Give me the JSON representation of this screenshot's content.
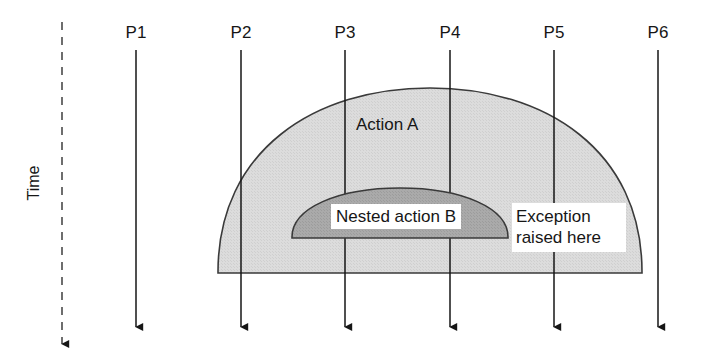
{
  "diagram": {
    "background_color": "#ffffff",
    "stroke_color": "#1a1a1a",
    "outer_region_fill": "#d9d9d9",
    "nested_region_fill": "#a8a8a8",
    "callout_fill": "#ffffff"
  },
  "axis": {
    "time_label": "Time",
    "time_arrow_direction": "down",
    "time_line_style": "dashed",
    "time_line_x": 62,
    "time_line_top_y": 22,
    "time_line_bottom_y": 352
  },
  "participants": [
    {
      "label": "P1",
      "x": 136,
      "line_top_y": 50,
      "line_bottom_y": 334
    },
    {
      "label": "P2",
      "x": 241,
      "line_top_y": 50,
      "line_bottom_y": 334
    },
    {
      "label": "P3",
      "x": 345,
      "line_top_y": 50,
      "line_bottom_y": 334
    },
    {
      "label": "P4",
      "x": 450,
      "line_top_y": 50,
      "line_bottom_y": 334
    },
    {
      "label": "P5",
      "x": 554,
      "line_top_y": 50,
      "line_bottom_y": 334
    },
    {
      "label": "P6",
      "x": 658,
      "line_top_y": 50,
      "line_bottom_y": 334
    }
  ],
  "regions": [
    {
      "name": "outer-action-region",
      "label": "Action A",
      "shape": "semicircle",
      "fill": "#d9d9d9",
      "left_x": 218,
      "right_x": 642,
      "baseline_y": 273,
      "apex_y": 88
    },
    {
      "name": "nested-action-region",
      "label": "Nested action B",
      "shape": "semicircle",
      "fill": "#a8a8a8",
      "left_x": 292,
      "right_x": 508,
      "baseline_y": 238,
      "apex_y": 188
    }
  ],
  "annotations": [
    {
      "name": "exception-callout",
      "line1": "Exception",
      "line2": "raised here",
      "text": "Exception raised here",
      "box_left": 511,
      "box_top": 202,
      "box_width": 112,
      "box_height": 42
    }
  ]
}
